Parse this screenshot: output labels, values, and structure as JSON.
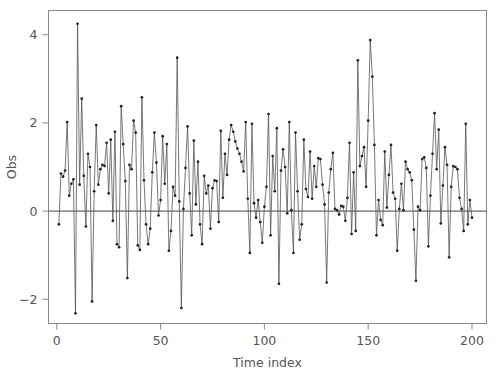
{
  "chart_data": {
    "type": "line",
    "title": "",
    "subtitle": "",
    "xlabel": "Time index",
    "ylabel": "Obs",
    "xlim": [
      -4,
      207
    ],
    "ylim": [
      -2.55,
      4.55
    ],
    "xticks": [
      0,
      50,
      100,
      150,
      200
    ],
    "yticks": [
      -2,
      0,
      2,
      4
    ],
    "xtick_labels": [
      "0",
      "50",
      "100",
      "150",
      "200"
    ],
    "ytick_labels": [
      "−2",
      "0",
      "2",
      "4"
    ],
    "grid": false,
    "legend": null,
    "reference_lines": [
      {
        "axis": "y",
        "value": 0,
        "color": "#444444"
      }
    ],
    "marker": "filled-circle",
    "line_color": "#555555",
    "marker_color": "#222222",
    "frame_color": "#888888",
    "series": [
      {
        "name": "Obs",
        "x": [
          1,
          2,
          3,
          4,
          5,
          6,
          7,
          8,
          9,
          10,
          11,
          12,
          13,
          14,
          15,
          16,
          17,
          18,
          19,
          20,
          21,
          22,
          23,
          24,
          25,
          26,
          27,
          28,
          29,
          30,
          31,
          32,
          33,
          34,
          35,
          36,
          37,
          38,
          39,
          40,
          41,
          42,
          43,
          44,
          45,
          46,
          47,
          48,
          49,
          50,
          51,
          52,
          53,
          54,
          55,
          56,
          57,
          58,
          59,
          60,
          61,
          62,
          63,
          64,
          65,
          66,
          67,
          68,
          69,
          70,
          71,
          72,
          73,
          74,
          75,
          76,
          77,
          78,
          79,
          80,
          81,
          82,
          83,
          84,
          85,
          86,
          87,
          88,
          89,
          90,
          91,
          92,
          93,
          94,
          95,
          96,
          97,
          98,
          99,
          100,
          101,
          102,
          103,
          104,
          105,
          106,
          107,
          108,
          109,
          110,
          111,
          112,
          113,
          114,
          115,
          116,
          117,
          118,
          119,
          120,
          121,
          122,
          123,
          124,
          125,
          126,
          127,
          128,
          129,
          130,
          131,
          132,
          133,
          134,
          135,
          136,
          137,
          138,
          139,
          140,
          141,
          142,
          143,
          144,
          145,
          146,
          147,
          148,
          149,
          150,
          151,
          152,
          153,
          154,
          155,
          156,
          157,
          158,
          159,
          160,
          161,
          162,
          163,
          164,
          165,
          166,
          167,
          168,
          169,
          170,
          171,
          172,
          173,
          174,
          175,
          176,
          177,
          178,
          179,
          180,
          181,
          182,
          183,
          184,
          185,
          186,
          187,
          188,
          189,
          190,
          191,
          192,
          193,
          194,
          195,
          196,
          197,
          198,
          199,
          200
        ],
        "values": [
          -0.3,
          0.85,
          0.78,
          0.92,
          2.02,
          0.35,
          0.62,
          0.72,
          -2.32,
          4.25,
          0.6,
          2.55,
          0.8,
          -0.35,
          1.3,
          1.0,
          -2.05,
          0.45,
          1.95,
          0.6,
          0.95,
          1.05,
          1.02,
          1.55,
          0.4,
          1.62,
          -0.22,
          1.8,
          -0.75,
          -0.82,
          2.38,
          1.52,
          0.68,
          -1.52,
          1.05,
          0.95,
          2.05,
          1.78,
          -0.78,
          -0.88,
          2.58,
          0.7,
          -0.3,
          -0.75,
          -0.4,
          0.88,
          1.78,
          1.1,
          -0.1,
          0.25,
          1.7,
          0.62,
          1.52,
          -0.9,
          -0.45,
          0.55,
          0.35,
          3.48,
          0.22,
          -2.2,
          0.05,
          0.98,
          1.92,
          0.4,
          -0.55,
          1.6,
          0.15,
          1.12,
          -0.3,
          -0.75,
          0.8,
          0.4,
          0.58,
          -0.4,
          0.52,
          0.7,
          0.68,
          -0.25,
          1.82,
          0.3,
          1.3,
          0.82,
          1.62,
          1.95,
          1.8,
          1.58,
          1.42,
          1.3,
          1.12,
          0.9,
          2.02,
          0.28,
          -0.95,
          1.98,
          0.18,
          -0.15,
          0.25,
          -0.25,
          -0.72,
          0.1,
          0.55,
          2.2,
          -0.55,
          1.25,
          0.45,
          1.88,
          -1.65,
          0.92,
          1.4,
          1.0,
          -0.05,
          2.02,
          0.02,
          -0.95,
          1.78,
          0.45,
          -0.65,
          -0.3,
          1.62,
          0.5,
          0.32,
          1.35,
          0.28,
          1.02,
          0.55,
          1.2,
          1.18,
          0.6,
          0.15,
          -1.62,
          0.42,
          0.95,
          1.32,
          0.05,
          0.02,
          -0.08,
          0.12,
          0.1,
          -0.22,
          0.3,
          1.55,
          -0.52,
          0.88,
          -0.45,
          3.42,
          1.02,
          1.25,
          1.45,
          0.55,
          2.05,
          3.88,
          3.05,
          1.5,
          -0.55,
          0.25,
          -0.2,
          -0.32,
          1.35,
          0.08,
          0.82,
          1.5,
          0.42,
          0.28,
          -0.9,
          0.05,
          0.62,
          0.02,
          1.12,
          0.95,
          0.88,
          0.7,
          -0.42,
          -1.58,
          0.1,
          0.02,
          1.18,
          1.22,
          0.98,
          -0.8,
          0.35,
          1.3,
          2.22,
          0.95,
          1.85,
          -0.28,
          0.58,
          1.45,
          1.05,
          -1.05,
          0.55,
          1.02,
          1.0,
          0.95,
          0.3,
          0.05,
          -0.45,
          1.98,
          -0.3,
          0.25,
          -0.15
        ]
      }
    ]
  }
}
